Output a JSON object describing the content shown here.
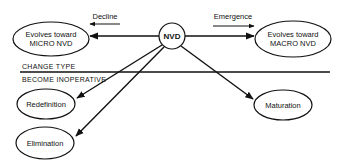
{
  "diagram": {
    "center_node": {
      "label": "NVD"
    },
    "nodes": {
      "micro": {
        "line1": "Evolves toward",
        "line2": "MICRO NVD"
      },
      "macro": {
        "line1": "Evolves toward",
        "line2": "MACRO NVD"
      },
      "redefinition": {
        "label": "Redefinition"
      },
      "elimination": {
        "label": "Elimination"
      },
      "maturation": {
        "label": "Maturation"
      }
    },
    "edge_labels": {
      "decline": "Decline",
      "emergence": "Emergence"
    },
    "divider": {
      "above": "CHANGE TYPE",
      "below": "BECOME INOPERATIVE"
    },
    "colors": {
      "ink": "#111111",
      "background": "#ffffff"
    }
  }
}
